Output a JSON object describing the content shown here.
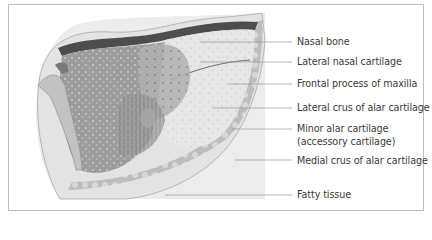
{
  "figure": {
    "labels": [
      {
        "id": "nasal-bone",
        "text": "Nasal bone",
        "y": 15
      },
      {
        "id": "lateral-nasal-cartilage",
        "text": "Lateral nasal cartilage",
        "y": 34
      },
      {
        "id": "frontal-process-of-maxilla",
        "text": "Frontal process of maxilla",
        "y": 56
      },
      {
        "id": "lateral-crus-of-alar-cartilage",
        "text": "Lateral crus of alar cartilage",
        "y": 78
      },
      {
        "id": "minor-alar-cartilage",
        "text": "Minor alar cartilage",
        "text2": "(accessory cartilage)",
        "y": 97
      },
      {
        "id": "medial-crus-of-alar-cartilage",
        "text": "Medial crus of alar cartilage",
        "y": 129
      },
      {
        "id": "fatty-tissue",
        "text": "Fatty tissue",
        "y": 163
      }
    ],
    "colors": {
      "frame": "#bdbdbd",
      "panel": "#ececec",
      "text": "#3a3a3a",
      "leader": "#9a9a9a"
    }
  }
}
